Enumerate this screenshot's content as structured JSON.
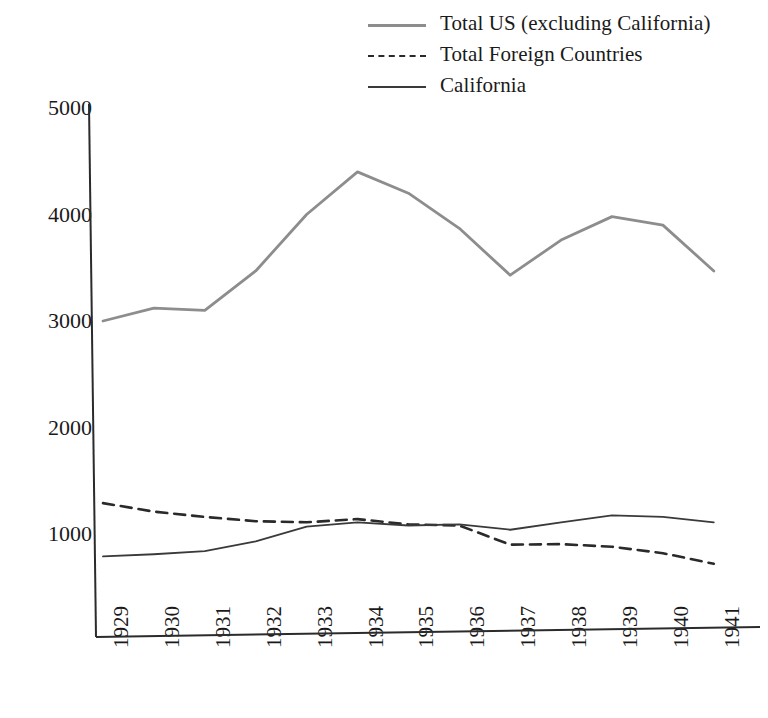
{
  "chart_data": {
    "type": "line",
    "title": "",
    "xlabel": "",
    "ylabel": "",
    "categories": [
      "1929",
      "1930",
      "1931",
      "1932",
      "1933",
      "1934",
      "1935",
      "1936",
      "1937",
      "1938",
      "1939",
      "1940",
      "1941"
    ],
    "x": [
      1929,
      1930,
      1931,
      1932,
      1933,
      1934,
      1935,
      1936,
      1937,
      1938,
      1939,
      1940,
      1941
    ],
    "ylim": [
      0,
      5000
    ],
    "yticks": [
      1000,
      2000,
      3000,
      4000,
      5000
    ],
    "ytick_labels": [
      "1000",
      "2000",
      "3000",
      "4000",
      "5000"
    ],
    "grid": false,
    "legend_position": "top-right",
    "series": [
      {
        "name": "Total US (excluding California)",
        "style": "solid",
        "color": "#8d8d8d",
        "values": [
          3000,
          3120,
          3100,
          3470,
          4000,
          4400,
          4200,
          3870,
          3430,
          3760,
          3980,
          3900,
          3470
        ]
      },
      {
        "name": "Total Foreign Countries",
        "style": "dashed",
        "color": "#2a2a2a",
        "values": [
          1290,
          1210,
          1160,
          1120,
          1110,
          1140,
          1090,
          1080,
          900,
          905,
          880,
          820,
          720
        ]
      },
      {
        "name": "California",
        "style": "solid",
        "color": "#3a3a3a",
        "values": [
          790,
          810,
          840,
          930,
          1070,
          1110,
          1080,
          1090,
          1040,
          1110,
          1175,
          1160,
          1110
        ]
      }
    ]
  },
  "legend": {
    "items": [
      {
        "label": "Total US (excluding California)",
        "swatch": "solid-gray"
      },
      {
        "label": "Total Foreign Countries",
        "swatch": "dashed"
      },
      {
        "label": "California",
        "swatch": "solid-dark"
      }
    ]
  },
  "axes": {
    "y_tick_labels": [
      "5000",
      "4000",
      "3000",
      "2000",
      "1000"
    ],
    "x_tick_labels": [
      "1929",
      "1930",
      "1931",
      "1932",
      "1933",
      "1934",
      "1935",
      "1936",
      "1937",
      "1938",
      "1939",
      "1940",
      "1941"
    ]
  }
}
